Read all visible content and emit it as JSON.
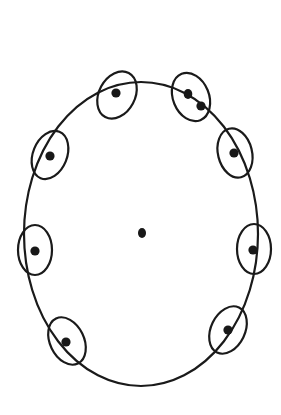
{
  "figure": {
    "background_color": "#ffffff",
    "stroke_color": "#1a1a1a",
    "dot_color": "#181818",
    "canvas": {
      "width": 281,
      "height": 415
    }
  },
  "chart_data": {
    "type": "scatter",
    "title": "",
    "xlabel": "",
    "ylabel": "",
    "xlim": [
      0,
      281
    ],
    "ylim": [
      0,
      415
    ],
    "grid": false,
    "legend": "none",
    "main_oval": {
      "label": "main-oval",
      "center_x": 141,
      "center_y": 234,
      "radius_x": 117,
      "radius_y": 152,
      "rotation_deg": 0,
      "stroke_width": 2.2
    },
    "center_point": {
      "label": "center-dot",
      "x": 142,
      "y": 233,
      "radius_x": 4.0,
      "radius_y": 5.0
    },
    "satellites": [
      {
        "label": "satellite-top-left",
        "index": 1,
        "ellipse_cx": 117,
        "ellipse_cy": 95,
        "ellipse_rx": 18,
        "ellipse_ry": 25,
        "rotation_deg": 28,
        "stroke_width": 2.2,
        "dot_x": 116,
        "dot_y": 93,
        "dot_rx": 4.6,
        "dot_ry": 4.6
      },
      {
        "label": "satellite-top-right",
        "index": 2,
        "ellipse_cx": 191,
        "ellipse_cy": 97,
        "ellipse_rx": 18,
        "ellipse_ry": 25,
        "rotation_deg": -22,
        "stroke_width": 2.2,
        "dot_x": 188,
        "dot_y": 94,
        "dot_rx": 4.3,
        "dot_ry": 5.0
      },
      {
        "label": "satellite-upper-right",
        "index": 3,
        "ellipse_cx": 235,
        "ellipse_cy": 153,
        "ellipse_rx": 17,
        "ellipse_ry": 25,
        "rotation_deg": -14,
        "stroke_width": 2.2,
        "dot_x": 234,
        "dot_y": 153,
        "dot_rx": 4.6,
        "dot_ry": 4.6
      },
      {
        "label": "satellite-right",
        "index": 4,
        "ellipse_cx": 254,
        "ellipse_cy": 249,
        "ellipse_rx": 17,
        "ellipse_ry": 25,
        "rotation_deg": 0,
        "stroke_width": 2.2,
        "dot_x": 253,
        "dot_y": 250,
        "dot_rx": 4.6,
        "dot_ry": 4.6
      },
      {
        "label": "satellite-lower-right",
        "index": 5,
        "ellipse_cx": 228,
        "ellipse_cy": 330,
        "ellipse_rx": 17,
        "ellipse_ry": 25,
        "rotation_deg": 26,
        "stroke_width": 2.2,
        "dot_x": 228,
        "dot_y": 330,
        "dot_rx": 4.6,
        "dot_ry": 4.6
      },
      {
        "label": "satellite-lower-left",
        "index": 6,
        "ellipse_cx": 67,
        "ellipse_cy": 341,
        "ellipse_rx": 17,
        "ellipse_ry": 25,
        "rotation_deg": -26,
        "stroke_width": 2.2,
        "dot_x": 66,
        "dot_y": 342,
        "dot_rx": 4.6,
        "dot_ry": 4.6
      },
      {
        "label": "satellite-left",
        "index": 7,
        "ellipse_cx": 35,
        "ellipse_cy": 250,
        "ellipse_rx": 17,
        "ellipse_ry": 25,
        "rotation_deg": 0,
        "stroke_width": 2.2,
        "dot_x": 35,
        "dot_y": 251,
        "dot_rx": 4.6,
        "dot_ry": 4.6
      },
      {
        "label": "satellite-upper-left",
        "index": 8,
        "ellipse_cx": 50,
        "ellipse_cy": 155,
        "ellipse_rx": 17,
        "ellipse_ry": 25,
        "rotation_deg": 22,
        "stroke_width": 2.2,
        "dot_x": 50,
        "dot_y": 156,
        "dot_rx": 4.6,
        "dot_ry": 4.6
      }
    ],
    "extra_points": [
      {
        "label": "extra-dot-top-right-on-ring",
        "x": 201,
        "y": 106,
        "radius_x": 4.6,
        "radius_y": 4.6
      }
    ]
  }
}
